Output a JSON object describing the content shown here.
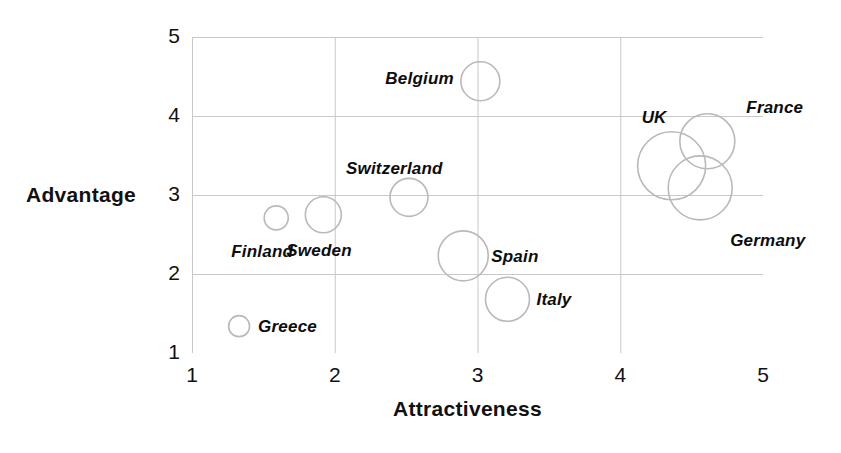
{
  "chart_data": {
    "type": "scatter",
    "title": "",
    "subtitle": "",
    "xlabel": "Attractiveness",
    "ylabel": "Advantage",
    "xlim": [
      1,
      5
    ],
    "ylim": [
      1,
      5
    ],
    "xticks": [
      "1",
      "2",
      "3",
      "4",
      "5"
    ],
    "yticks": [
      "1",
      "2",
      "3",
      "4",
      "5"
    ],
    "grid": true,
    "legend": "none",
    "bubble_size_meaning": "market size",
    "marker_style": "open circle, grey outline, no fill",
    "points": [
      {
        "label": "Belgium",
        "x": 3.02,
        "y": 4.44,
        "r": 19.5,
        "label_dx": -95,
        "label_dy": -12
      },
      {
        "label": "Switzerland",
        "x": 2.52,
        "y": 2.97,
        "r": 19.0,
        "label_dx": -63,
        "label_dy": -38
      },
      {
        "label": "Sweden",
        "x": 1.92,
        "y": 2.75,
        "r": 18.0,
        "label_dx": -37,
        "label_dy": 26
      },
      {
        "label": "Finland",
        "x": 1.59,
        "y": 2.71,
        "r": 12.0,
        "label_dx": -45,
        "label_dy": 24
      },
      {
        "label": "Greece",
        "x": 1.33,
        "y": 1.34,
        "r": 10.5,
        "label_dx": 19,
        "label_dy": -9
      },
      {
        "label": "Spain",
        "x": 2.9,
        "y": 2.23,
        "r": 25.0,
        "label_dx": 28,
        "label_dy": -9
      },
      {
        "label": "Italy",
        "x": 3.21,
        "y": 1.68,
        "r": 22.0,
        "label_dx": 29,
        "label_dy": -9
      },
      {
        "label": "UK",
        "x": 4.36,
        "y": 3.37,
        "r": 34.0,
        "label_dx": -30,
        "label_dy": -58
      },
      {
        "label": "France",
        "x": 4.61,
        "y": 3.68,
        "r": 27.5,
        "label_dx": 39,
        "label_dy": -43
      },
      {
        "label": "Germany",
        "x": 4.56,
        "y": 3.09,
        "r": 32.0,
        "label_dx": 30,
        "label_dy": 43
      }
    ]
  },
  "colors": {
    "bubble_stroke": "#b9b9b9",
    "grid": "#c9c9c9",
    "text": "#111111",
    "background": "#ffffff"
  }
}
